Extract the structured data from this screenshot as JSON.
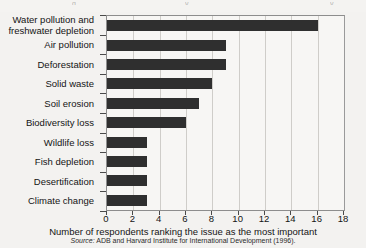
{
  "figure": {
    "background_color": "#f3f2f0",
    "bar_color": "#2f2f2f",
    "gridline_color": "#cfcdc9",
    "axis_color": "#4a4a4a",
    "axis_title": "Number of respondents ranking the issue as the most important",
    "source_prefix": "Source:",
    "source_text": "ADB and Harvard Institute for International Development (1996)."
  },
  "chart_data": {
    "type": "bar",
    "orientation": "horizontal",
    "title": "",
    "xlabel": "Number of respondents ranking the issue as the most important",
    "ylabel": "",
    "xlim": [
      0,
      18
    ],
    "xticks": [
      0,
      2,
      4,
      6,
      8,
      10,
      12,
      14,
      16,
      18
    ],
    "grid": "vertical",
    "legend": "none",
    "categories": [
      "Water pollution and freshwater depletion",
      "Air pollution",
      "Deforestation",
      "Solid waste",
      "Soil erosion",
      "Biodiversity loss",
      "Wildlife loss",
      "Fish depletion",
      "Desertification",
      "Climate change"
    ],
    "values": [
      16,
      9,
      9,
      8,
      7,
      6,
      3,
      3,
      3,
      3
    ],
    "source": "ADB and Harvard Institute for International Development (1996)."
  }
}
